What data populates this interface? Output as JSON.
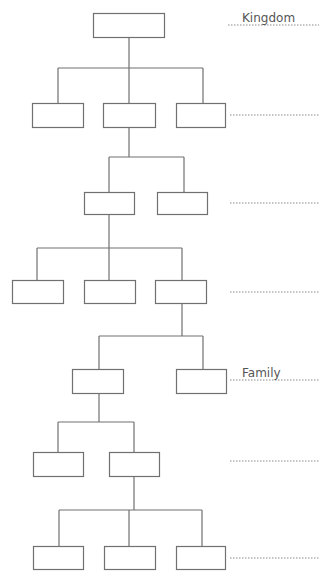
{
  "diagram": {
    "colors": {
      "line": "#707070",
      "dotted": "#8a8a8a",
      "text": "#555555",
      "background": "#ffffff"
    },
    "boxes": [
      {
        "id": "b0",
        "x": 93,
        "y": 13,
        "w": 71,
        "h": 24,
        "level": 0
      },
      {
        "id": "b1",
        "x": 32,
        "y": 103,
        "w": 51,
        "h": 24,
        "level": 1
      },
      {
        "id": "b2",
        "x": 103,
        "y": 103,
        "w": 52,
        "h": 24,
        "level": 1
      },
      {
        "id": "b3",
        "x": 176,
        "y": 103,
        "w": 49,
        "h": 24,
        "level": 1
      },
      {
        "id": "b4",
        "x": 84,
        "y": 192,
        "w": 50,
        "h": 22,
        "level": 2
      },
      {
        "id": "b5",
        "x": 157,
        "y": 192,
        "w": 50,
        "h": 22,
        "level": 2
      },
      {
        "id": "b6",
        "x": 12,
        "y": 280,
        "w": 51,
        "h": 23,
        "level": 3
      },
      {
        "id": "b7",
        "x": 84,
        "y": 280,
        "w": 51,
        "h": 23,
        "level": 3
      },
      {
        "id": "b8",
        "x": 155,
        "y": 280,
        "w": 51,
        "h": 23,
        "level": 3
      },
      {
        "id": "b9",
        "x": 72,
        "y": 369,
        "w": 51,
        "h": 24,
        "level": 4
      },
      {
        "id": "b10",
        "x": 176,
        "y": 369,
        "w": 50,
        "h": 24,
        "level": 4
      },
      {
        "id": "b11",
        "x": 33,
        "y": 452,
        "w": 50,
        "h": 24,
        "level": 5
      },
      {
        "id": "b12",
        "x": 109,
        "y": 452,
        "w": 50,
        "h": 24,
        "level": 5
      },
      {
        "id": "b13",
        "x": 33,
        "y": 546,
        "w": 50,
        "h": 23,
        "level": 6
      },
      {
        "id": "b14",
        "x": 104,
        "y": 546,
        "w": 51,
        "h": 23,
        "level": 6
      },
      {
        "id": "b15",
        "x": 176,
        "y": 546,
        "w": 49,
        "h": 23,
        "level": 6
      }
    ],
    "connectors": [
      {
        "from_x": 129,
        "from_y": 37,
        "bar_y": 68,
        "children_x": [
          58,
          129,
          203
        ],
        "child_top": 103
      },
      {
        "from_x": 129,
        "from_y": 127,
        "bar_y": 157,
        "children_x": [
          109,
          184
        ],
        "child_top": 192
      },
      {
        "from_x": 109,
        "from_y": 214,
        "bar_y": 248,
        "children_x": [
          37,
          109,
          182
        ],
        "child_top": 280
      },
      {
        "from_x": 182,
        "from_y": 303,
        "bar_y": 336,
        "children_x": [
          99,
          203
        ],
        "child_top": 369
      },
      {
        "from_x": 99,
        "from_y": 393,
        "bar_y": 422,
        "children_x": [
          58,
          134
        ],
        "child_top": 452
      },
      {
        "from_x": 134,
        "from_y": 476,
        "bar_y": 510,
        "children_x": [
          59,
          129,
          202
        ],
        "child_top": 546
      }
    ],
    "rank_lines": [
      {
        "y": 25,
        "x1": 228,
        "x2": 319,
        "label": "Kingdom"
      },
      {
        "y": 115,
        "x1": 230,
        "x2": 319,
        "label": ""
      },
      {
        "y": 203,
        "x1": 230,
        "x2": 319,
        "label": ""
      },
      {
        "y": 292,
        "x1": 230,
        "x2": 319,
        "label": ""
      },
      {
        "y": 380,
        "x1": 230,
        "x2": 319,
        "label": "Family"
      },
      {
        "y": 461,
        "x1": 230,
        "x2": 319,
        "label": ""
      },
      {
        "y": 558,
        "x1": 230,
        "x2": 319,
        "label": ""
      }
    ]
  },
  "labels": {
    "kingdom": "Kingdom",
    "family": "Family"
  }
}
